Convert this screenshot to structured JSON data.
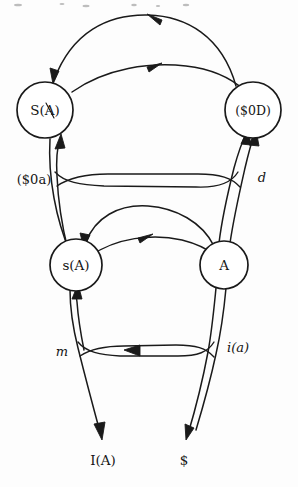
{
  "diagram": {
    "style": "hand-drawn ink sketch on white paper",
    "ink_color": "#1a1a1a",
    "paper_color": "#fdfdfd",
    "nodes": [
      {
        "id": "top-left",
        "label": "S(A)",
        "x": 45,
        "y": 110,
        "r": 28
      },
      {
        "id": "top-right",
        "label": "($0D)",
        "x": 253,
        "y": 110,
        "r": 28
      },
      {
        "id": "bottom-left",
        "label": "s(A)",
        "x": 76,
        "y": 265,
        "r": 26
      },
      {
        "id": "bottom-right",
        "label": "A",
        "x": 224,
        "y": 265,
        "r": 24
      }
    ],
    "edge_labels": [
      {
        "id": "left-vertical-label",
        "label": "($0a)",
        "x": 34,
        "y": 180
      },
      {
        "id": "right-vertical-label",
        "label": "d",
        "x": 262,
        "y": 178
      },
      {
        "id": "lower-left-label",
        "label": "m",
        "x": 62,
        "y": 352
      },
      {
        "id": "lower-right-label",
        "label": "i(a)",
        "x": 238,
        "y": 348
      }
    ],
    "terminals": [
      {
        "id": "terminal-left",
        "label": "I(A)",
        "x": 103,
        "y": 461
      },
      {
        "id": "terminal-right",
        "label": "$",
        "x": 184,
        "y": 461
      }
    ],
    "arcs": [
      {
        "id": "top-outer-arc",
        "from": "top-right",
        "to": "top-left",
        "direction": "leftward"
      },
      {
        "id": "top-inner-arc",
        "from": "top-left",
        "to": "top-right",
        "direction": "rightward"
      },
      {
        "id": "mid-outer-arc",
        "from": "bottom-right",
        "to": "bottom-left",
        "direction": "leftward"
      },
      {
        "id": "mid-inner-arc",
        "from": "bottom-left",
        "to": "bottom-right",
        "direction": "rightward"
      },
      {
        "id": "middle-horizontal",
        "from": "left-rail",
        "to": "right-rail",
        "direction": "horizontal"
      },
      {
        "id": "lower-horizontal",
        "from": "right-rail",
        "to": "left-rail",
        "direction": "leftward"
      }
    ]
  }
}
